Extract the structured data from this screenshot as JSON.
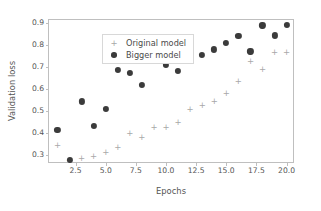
{
  "chart_data": {
    "type": "scatter",
    "title": "",
    "xlabel": "Epochs",
    "ylabel": "Validation loss",
    "xlim": [
      0.3,
      20.7
    ],
    "ylim": [
      0.258,
      0.915
    ],
    "grid": false,
    "legend_position": "upper left",
    "xticks": [
      2.5,
      5.0,
      7.5,
      10.0,
      12.5,
      15.0,
      17.5,
      20.0
    ],
    "xticklabels": [
      "2.5",
      "5.0",
      "7.5",
      "10.0",
      "12.5",
      "15.0",
      "17.5",
      "20.0"
    ],
    "yticks": [
      0.3,
      0.4,
      0.5,
      0.6,
      0.7,
      0.8,
      0.9
    ],
    "yticklabels": [
      "0.3",
      "0.4",
      "0.5",
      "0.6",
      "0.7",
      "0.8",
      "0.9"
    ],
    "x": [
      1,
      2,
      3,
      4,
      5,
      6,
      7,
      8,
      9,
      10,
      11,
      12,
      13,
      14,
      15,
      16,
      17,
      18,
      19,
      20
    ],
    "series": [
      {
        "name": "Original model",
        "marker": "plus",
        "color": "#a8a8a8",
        "values": [
          0.344,
          0.277,
          0.286,
          0.293,
          0.312,
          0.334,
          0.401,
          0.379,
          0.425,
          0.426,
          0.451,
          0.51,
          0.528,
          0.545,
          0.58,
          0.638,
          0.727,
          0.692,
          0.77,
          0.77
        ]
      },
      {
        "name": "Bigger model",
        "marker": "circle",
        "color": "#3b3b3b",
        "values": [
          0.415,
          0.277,
          0.544,
          0.432,
          0.51,
          0.688,
          0.673,
          0.619,
          0.733,
          0.71,
          0.683,
          0.801,
          0.755,
          0.781,
          0.811,
          0.841,
          0.772,
          0.89,
          0.845,
          0.893
        ]
      }
    ]
  }
}
